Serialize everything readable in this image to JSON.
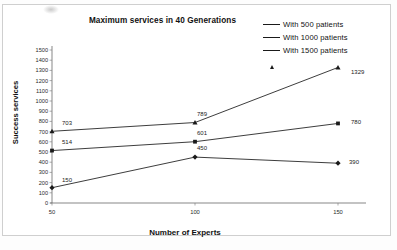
{
  "chart_data": {
    "type": "line",
    "title": "Maximum services in 40 Generations",
    "xlabel": "Number of Experts",
    "ylabel": "Success services",
    "x": [
      50,
      100,
      150
    ],
    "xtick_labels": [
      "50",
      "100",
      "150"
    ],
    "ytick_labels": [
      "1500",
      "1400",
      "1300",
      "1200",
      "1100",
      "1000",
      "900",
      "800",
      "700",
      "600",
      "500",
      "400",
      "300",
      "200",
      "100",
      "0"
    ],
    "ylim": [
      0,
      1500
    ],
    "ytick_step": 100,
    "grid": false,
    "legend_position": "top-right",
    "series": [
      {
        "name": "With 500 patients",
        "marker": "diamond",
        "values": [
          150,
          450,
          390
        ],
        "point_labels": [
          "150",
          "450",
          "390"
        ]
      },
      {
        "name": "With 1000 patients",
        "marker": "square",
        "values": [
          514,
          601,
          780
        ],
        "point_labels": [
          "514",
          "601",
          "780"
        ]
      },
      {
        "name": "With 1500 patients",
        "marker": "triangle",
        "values": [
          703,
          789,
          1329
        ],
        "point_labels": [
          "703",
          "789",
          "1329"
        ]
      }
    ],
    "line_color": "#1a1a1a",
    "background_color": "#ffffff"
  }
}
